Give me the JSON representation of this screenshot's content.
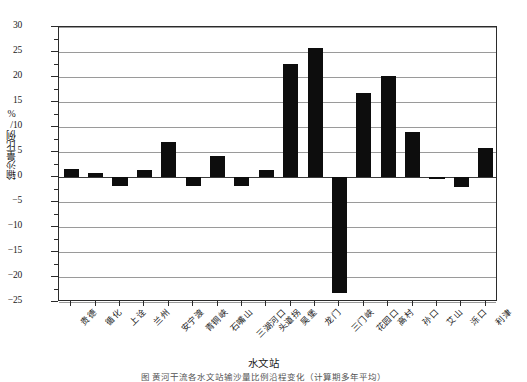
{
  "chart_data": {
    "type": "bar",
    "title": "",
    "xlabel": "水文站",
    "ylabel": "输沙量比例/%",
    "ylim": [
      -25,
      30
    ],
    "ytick_step": 5,
    "grid": true,
    "legend": "none",
    "bar_color": "#0d0d0d",
    "categories": [
      "贵德",
      "循化",
      "上诠",
      "兰州",
      "安宁渡",
      "青铜峡",
      "石嘴山",
      "三湖河口",
      "头道拐",
      "吴堡",
      "龙门",
      "三门峡",
      "花园口",
      "高村",
      "孙口",
      "艾山",
      "泺口",
      "利津"
    ],
    "values": [
      1.7,
      0.9,
      -1.7,
      1.5,
      7.1,
      -1.7,
      4.3,
      -1.8,
      1.5,
      22.6,
      25.8,
      -23.1,
      16.8,
      20.3,
      9.0,
      -0.4,
      -1.9,
      5.8
    ],
    "ytick_labels": [
      "30",
      "25",
      "20",
      "15",
      "10",
      "5",
      "0",
      "−5",
      "−10",
      "−15",
      "−20",
      "−25"
    ],
    "ytick_values": [
      30,
      25,
      20,
      15,
      10,
      5,
      0,
      -5,
      -10,
      -15,
      -20,
      -25
    ]
  },
  "caption": {
    "text": "图 黄河干流各水文站输沙量比例沿程变化（计算期多年平均）"
  }
}
